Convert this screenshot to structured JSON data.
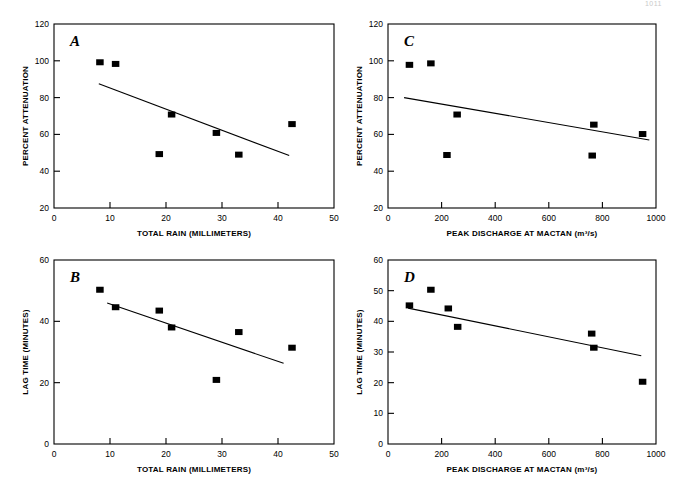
{
  "page": {
    "number": "1011",
    "caption": ""
  },
  "figure": {
    "marker_color": "#000000",
    "line_color": "#000000",
    "axis_color": "#000000"
  },
  "chart_data": [
    {
      "id": "A",
      "panel_letter": "A",
      "type": "scatter",
      "title": "",
      "xlabel": "TOTAL RAIN (MILLIMETERS)",
      "ylabel": "PERCENT ATTENUATION",
      "xlim": [
        0,
        50
      ],
      "ylim": [
        20,
        120
      ],
      "xticks": [
        0,
        10,
        20,
        30,
        40,
        50
      ],
      "yticks": [
        20,
        40,
        60,
        80,
        100,
        120
      ],
      "grid": false,
      "legend": "none",
      "x": [
        8.2,
        11.0,
        18.8,
        21.0,
        29.0,
        33.0,
        42.5
      ],
      "y": [
        99.2,
        98.3,
        49.3,
        70.8,
        60.8,
        49.0,
        65.6
      ],
      "fit_line": {
        "x": [
          8.0,
          42.0
        ],
        "y": [
          87.5,
          48.5
        ]
      }
    },
    {
      "id": "B",
      "panel_letter": "B",
      "type": "scatter",
      "title": "",
      "xlabel": "TOTAL RAIN (MILLIMETERS)",
      "ylabel": "LAG TIME (MINUTES)",
      "xlim": [
        0,
        50
      ],
      "ylim": [
        0,
        60
      ],
      "xticks": [
        0,
        10,
        20,
        30,
        40,
        50
      ],
      "yticks": [
        0,
        20,
        40,
        60
      ],
      "grid": false,
      "legend": "none",
      "x": [
        8.2,
        11.0,
        18.8,
        21.0,
        29.0,
        33.0,
        42.5
      ],
      "y": [
        50.3,
        44.6,
        43.5,
        38.0,
        20.9,
        36.5,
        31.4
      ],
      "fit_line": {
        "x": [
          9.5,
          41.0
        ],
        "y": [
          46.0,
          26.3
        ]
      }
    },
    {
      "id": "C",
      "panel_letter": "C",
      "type": "scatter",
      "title": "",
      "xlabel": "PEAK DISCHARGE AT MACTAN (m³/s)",
      "ylabel": "PERCENT ATTENUATION",
      "xlim": [
        0,
        1000
      ],
      "ylim": [
        20,
        120
      ],
      "xticks": [
        0,
        200,
        400,
        600,
        800,
        1000
      ],
      "yticks": [
        20,
        40,
        60,
        80,
        100,
        120
      ],
      "grid": false,
      "legend": "none",
      "x": [
        80,
        160,
        220,
        258,
        762,
        768,
        950
      ],
      "y": [
        97.8,
        98.6,
        48.8,
        70.8,
        48.5,
        65.3,
        60.2
      ],
      "fit_line": {
        "x": [
          60,
          975
        ],
        "y": [
          80.0,
          57.0
        ]
      }
    },
    {
      "id": "D",
      "panel_letter": "D",
      "type": "scatter",
      "title": "",
      "xlabel": "PEAK DISCHARGE AT MACTAN (m³/s)",
      "ylabel": "LAG TIME (MINUTES)",
      "xlim": [
        0,
        1000
      ],
      "ylim": [
        0,
        60
      ],
      "xticks": [
        0,
        200,
        400,
        600,
        800,
        1000
      ],
      "yticks": [
        0,
        10,
        20,
        30,
        40,
        50,
        60
      ],
      "grid": false,
      "legend": "none",
      "x": [
        80,
        160,
        225,
        260,
        760,
        768,
        950
      ],
      "y": [
        45.2,
        50.3,
        44.2,
        38.2,
        36.0,
        31.4,
        20.3
      ],
      "fit_line": {
        "x": [
          75,
          945
        ],
        "y": [
          44.3,
          28.8
        ]
      }
    }
  ]
}
